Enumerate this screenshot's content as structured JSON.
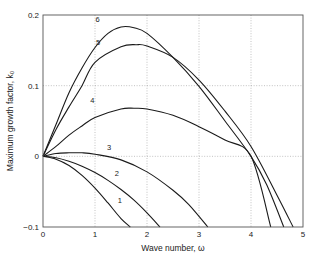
{
  "chart_data": {
    "type": "line",
    "title": "",
    "xlabel": "Wave number, ω",
    "ylabel": "Maximum growth factor, k₀",
    "xlim": [
      0,
      5
    ],
    "ylim": [
      -0.1,
      0.2
    ],
    "xticks": [
      0,
      1,
      2,
      3,
      4,
      5
    ],
    "xtick_labels": [
      "0",
      "1",
      "2",
      "3",
      "4",
      "5"
    ],
    "yticks": [
      -0.1,
      0,
      0.1,
      0.2
    ],
    "ytick_labels": [
      "−0.1",
      "0",
      "0.1",
      "0.2"
    ],
    "grid": true,
    "legend": "none (curves labeled inline 1–6)",
    "series": [
      {
        "name": "1",
        "label_pos": [
          1.48,
          -0.066
        ],
        "x": [
          0,
          0.25,
          0.5,
          0.75,
          1.0,
          1.25,
          1.5,
          1.68
        ],
        "y": [
          0,
          -0.004,
          -0.013,
          -0.027,
          -0.045,
          -0.066,
          -0.088,
          -0.1
        ]
      },
      {
        "name": "2",
        "label_pos": [
          1.42,
          -0.028
        ],
        "x": [
          0,
          0.25,
          0.5,
          0.75,
          1.0,
          1.25,
          1.5,
          1.75,
          2.0,
          2.25
        ],
        "y": [
          0,
          -0.002,
          -0.007,
          -0.014,
          -0.023,
          -0.034,
          -0.047,
          -0.062,
          -0.08,
          -0.1
        ]
      },
      {
        "name": "3",
        "label_pos": [
          1.27,
          0.009
        ],
        "x": [
          0,
          0.25,
          0.5,
          0.75,
          1.0,
          1.5,
          2.0,
          2.5,
          2.8,
          3.17
        ],
        "y": [
          0,
          0.004,
          0.005,
          0.005,
          0.003,
          -0.005,
          -0.022,
          -0.048,
          -0.068,
          -0.1
        ]
      },
      {
        "name": "4",
        "label_pos": [
          0.95,
          0.075
        ],
        "x": [
          0,
          0.25,
          0.5,
          0.75,
          1.0,
          1.5,
          1.75,
          2.0,
          2.5,
          3.0,
          3.5,
          4.0,
          4.38
        ],
        "y": [
          0,
          0.014,
          0.03,
          0.043,
          0.055,
          0.067,
          0.068,
          0.067,
          0.058,
          0.042,
          0.023,
          0.0,
          -0.1
        ]
      },
      {
        "name": "5",
        "label_pos": [
          1.06,
          0.157
        ],
        "x": [
          0,
          0.25,
          0.5,
          0.75,
          1.0,
          1.5,
          1.8,
          2.0,
          2.5,
          3.0,
          3.5,
          4.0,
          4.5,
          4.81
        ],
        "y": [
          0,
          0.038,
          0.07,
          0.1,
          0.133,
          0.155,
          0.158,
          0.156,
          0.14,
          0.108,
          0.064,
          0.014,
          -0.055,
          -0.1
        ]
      },
      {
        "name": "6",
        "label_pos": [
          1.05,
          0.19
        ],
        "x": [
          0,
          0.25,
          0.5,
          0.75,
          1.0,
          1.25,
          1.5,
          1.75,
          2.0,
          2.5,
          3.0,
          3.5,
          4.0,
          4.3,
          4.63
        ],
        "y": [
          0,
          0.045,
          0.09,
          0.125,
          0.154,
          0.174,
          0.183,
          0.182,
          0.174,
          0.14,
          0.099,
          0.05,
          0.0,
          -0.04,
          -0.1
        ]
      }
    ]
  },
  "plot_area": {
    "left": 43,
    "top": 15,
    "right": 303,
    "bottom": 227
  }
}
